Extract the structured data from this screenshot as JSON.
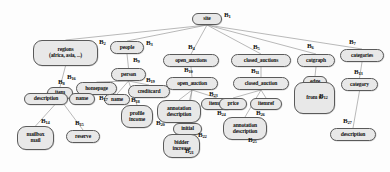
{
  "diagram": {
    "background": "#fdfdfd",
    "node_fill": "#e8e8e8",
    "node_stroke": "#5a5a5a",
    "edge_color": "#8a8a8a",
    "label_color": "#111111"
  },
  "nodes": [
    {
      "id": "site",
      "lines": [
        "site"
      ],
      "x": 192,
      "y": 13,
      "w": 30,
      "h": 12,
      "fs": 5.6
    },
    {
      "id": "regions",
      "lines": [
        "regions",
        "(africa, asia, ...)"
      ],
      "x": 33,
      "y": 40,
      "w": 65,
      "h": 26,
      "fs": 5.6
    },
    {
      "id": "people",
      "lines": [
        "people"
      ],
      "x": 110,
      "y": 41,
      "w": 34,
      "h": 13,
      "fs": 5.6
    },
    {
      "id": "open_auctions",
      "lines": [
        "open_auctions"
      ],
      "x": 163,
      "y": 54,
      "w": 56,
      "h": 13,
      "fs": 5.6
    },
    {
      "id": "closed_auctions",
      "lines": [
        "closed_auctions"
      ],
      "x": 231,
      "y": 54,
      "w": 60,
      "h": 13,
      "fs": 5.6
    },
    {
      "id": "catgraph",
      "lines": [
        "catgraph"
      ],
      "x": 297,
      "y": 54,
      "w": 38,
      "h": 13,
      "fs": 5.6
    },
    {
      "id": "categories",
      "lines": [
        "categories"
      ],
      "x": 340,
      "y": 49,
      "w": 44,
      "h": 13,
      "fs": 5.6
    },
    {
      "id": "person",
      "lines": [
        "person"
      ],
      "x": 111,
      "y": 68,
      "w": 35,
      "h": 13,
      "fs": 5.6
    },
    {
      "id": "open_auction",
      "lines": [
        "open_auction"
      ],
      "x": 166,
      "y": 77,
      "w": 52,
      "h": 13,
      "fs": 5.6
    },
    {
      "id": "closed_auction",
      "lines": [
        "closed_auction"
      ],
      "x": 233,
      "y": 77,
      "w": 56,
      "h": 13,
      "fs": 5.6
    },
    {
      "id": "edge",
      "lines": [
        "edge"
      ],
      "x": 303,
      "y": 76,
      "w": 24,
      "h": 12,
      "fs": 5.6
    },
    {
      "id": "category",
      "lines": [
        "category"
      ],
      "x": 341,
      "y": 78,
      "w": 37,
      "h": 13,
      "fs": 5.6
    },
    {
      "id": "item",
      "lines": [
        "item"
      ],
      "x": 47,
      "y": 87,
      "w": 26,
      "h": 12,
      "fs": 5.6
    },
    {
      "id": "homepage",
      "lines": [
        "homepage"
      ],
      "x": 76,
      "y": 82,
      "w": 41,
      "h": 13,
      "fs": 5.6
    },
    {
      "id": "creditcard",
      "lines": [
        "creditcard"
      ],
      "x": 128,
      "y": 85,
      "w": 42,
      "h": 13,
      "fs": 5.6
    },
    {
      "id": "name_person",
      "lines": [
        "name"
      ],
      "x": 104,
      "y": 94,
      "w": 26,
      "h": 11,
      "fs": 5.4
    },
    {
      "id": "description_item",
      "lines": [
        "description"
      ],
      "x": 24,
      "y": 93,
      "w": 44,
      "h": 12,
      "fs": 5.6
    },
    {
      "id": "name_item",
      "lines": [
        "name"
      ],
      "x": 69,
      "y": 93,
      "w": 26,
      "h": 12,
      "fs": 5.6
    },
    {
      "id": "profile_income",
      "lines": [
        "profile",
        "income"
      ],
      "x": 121,
      "y": 105,
      "w": 32,
      "h": 23,
      "fs": 5.6
    },
    {
      "id": "annotation_open",
      "lines": [
        "annotation",
        "description"
      ],
      "x": 157,
      "y": 100,
      "w": 44,
      "h": 23,
      "fs": 5.6
    },
    {
      "id": "itemref_open",
      "lines": [
        "itemref"
      ],
      "x": 201,
      "y": 98,
      "w": 32,
      "h": 12,
      "fs": 5.6
    },
    {
      "id": "initial",
      "lines": [
        "initial"
      ],
      "x": 173,
      "y": 123,
      "w": 29,
      "h": 12,
      "fs": 5.6
    },
    {
      "id": "bidder_increase",
      "lines": [
        "bidder",
        "increase"
      ],
      "x": 163,
      "y": 134,
      "w": 37,
      "h": 24,
      "fs": 5.6
    },
    {
      "id": "price",
      "lines": [
        "price"
      ],
      "x": 219,
      "y": 98,
      "w": 28,
      "h": 12,
      "fs": 5.6
    },
    {
      "id": "itemref_closed",
      "lines": [
        "itemref"
      ],
      "x": 250,
      "y": 98,
      "w": 32,
      "h": 12,
      "fs": 5.6
    },
    {
      "id": "annotation_cl",
      "lines": [
        "annotation",
        "description"
      ],
      "x": 223,
      "y": 117,
      "w": 44,
      "h": 23,
      "fs": 5.6
    },
    {
      "id": "from_to",
      "lines": [
        "from  to"
      ],
      "x": 294,
      "y": 82,
      "w": 41,
      "h": 32,
      "fs": 5.6
    },
    {
      "id": "mailbox_mail",
      "lines": [
        "mailbox",
        "mail"
      ],
      "x": 17,
      "y": 126,
      "w": 37,
      "h": 24,
      "fs": 5.6
    },
    {
      "id": "reserve",
      "lines": [
        "reserve"
      ],
      "x": 66,
      "y": 130,
      "w": 34,
      "h": 13,
      "fs": 5.6
    },
    {
      "id": "description_cat",
      "lines": [
        "description"
      ],
      "x": 330,
      "y": 128,
      "w": 46,
      "h": 13,
      "fs": 5.6
    }
  ],
  "block_labels": [
    {
      "id": "B1",
      "text": "B",
      "sub": "1",
      "x": 224,
      "y": 11
    },
    {
      "id": "B2",
      "text": "B",
      "sub": "2",
      "x": 99,
      "y": 38
    },
    {
      "id": "B3",
      "text": "B",
      "sub": "3",
      "x": 146,
      "y": 39
    },
    {
      "id": "B4",
      "text": "B",
      "sub": "4",
      "x": 188,
      "y": 43
    },
    {
      "id": "B5",
      "text": "B",
      "sub": "5",
      "x": 253,
      "y": 43
    },
    {
      "id": "B6",
      "text": "B",
      "sub": "6",
      "x": 307,
      "y": 42
    },
    {
      "id": "B7",
      "text": "B",
      "sub": "7",
      "x": 349,
      "y": 38
    },
    {
      "id": "B8",
      "text": "B",
      "sub": "8",
      "x": 58,
      "y": 78
    },
    {
      "id": "B9",
      "text": "B",
      "sub": "9",
      "x": 133,
      "y": 56
    },
    {
      "id": "B10",
      "text": "B",
      "sub": "10",
      "x": 184,
      "y": 66
    },
    {
      "id": "B11",
      "text": "B",
      "sub": "11",
      "x": 251,
      "y": 67
    },
    {
      "id": "B12",
      "text": "B",
      "sub": "12",
      "x": 319,
      "y": 92
    },
    {
      "id": "B13",
      "text": "B",
      "sub": "13",
      "x": 354,
      "y": 68
    },
    {
      "id": "B14",
      "text": "B",
      "sub": "14",
      "x": 41,
      "y": 117
    },
    {
      "id": "B15",
      "text": "B",
      "sub": "15",
      "x": 75,
      "y": 119
    },
    {
      "id": "B16",
      "text": "B",
      "sub": "16",
      "x": 67,
      "y": 73
    },
    {
      "id": "B17",
      "text": "B",
      "sub": "17",
      "x": 99,
      "y": 94
    },
    {
      "id": "B18",
      "text": "B",
      "sub": "18",
      "x": 131,
      "y": 96
    },
    {
      "id": "B19",
      "text": "B",
      "sub": "19",
      "x": 146,
      "y": 76
    },
    {
      "id": "B20",
      "text": "B",
      "sub": "20",
      "x": 156,
      "y": 119
    },
    {
      "id": "B21",
      "text": "B",
      "sub": "21",
      "x": 185,
      "y": 147
    },
    {
      "id": "B22",
      "text": "B",
      "sub": "22",
      "x": 198,
      "y": 131
    },
    {
      "id": "B23",
      "text": "B",
      "sub": "23",
      "x": 209,
      "y": 90
    },
    {
      "id": "B24",
      "text": "B",
      "sub": "24",
      "x": 217,
      "y": 109
    },
    {
      "id": "B25",
      "text": "B",
      "sub": "25",
      "x": 248,
      "y": 136
    },
    {
      "id": "B26",
      "text": "B",
      "sub": "26",
      "x": 256,
      "y": 109
    },
    {
      "id": "B27",
      "text": "B",
      "sub": "27",
      "x": 343,
      "y": 117
    }
  ],
  "edges": [
    {
      "from": "site",
      "to": "regions"
    },
    {
      "from": "site",
      "to": "people"
    },
    {
      "from": "site",
      "to": "open_auctions"
    },
    {
      "from": "site",
      "to": "closed_auctions"
    },
    {
      "from": "site",
      "to": "catgraph"
    },
    {
      "from": "site",
      "to": "categories"
    },
    {
      "from": "regions",
      "to": "item"
    },
    {
      "from": "people",
      "to": "person"
    },
    {
      "from": "open_auctions",
      "to": "open_auction"
    },
    {
      "from": "closed_auctions",
      "to": "closed_auction"
    },
    {
      "from": "catgraph",
      "to": "edge"
    },
    {
      "from": "categories",
      "to": "category"
    },
    {
      "from": "person",
      "to": "homepage"
    },
    {
      "from": "person",
      "to": "name_person"
    },
    {
      "from": "person",
      "to": "creditcard"
    },
    {
      "from": "person",
      "to": "profile_income"
    },
    {
      "from": "item",
      "to": "description_item"
    },
    {
      "from": "item",
      "to": "name_item"
    },
    {
      "from": "item",
      "to": "mailbox_mail"
    },
    {
      "from": "item",
      "to": "reserve"
    },
    {
      "from": "open_auction",
      "to": "annotation_open"
    },
    {
      "from": "open_auction",
      "to": "itemref_open"
    },
    {
      "from": "open_auction",
      "to": "initial"
    },
    {
      "from": "open_auction",
      "to": "bidder_increase"
    },
    {
      "from": "closed_auction",
      "to": "price"
    },
    {
      "from": "closed_auction",
      "to": "itemref_closed"
    },
    {
      "from": "closed_auction",
      "to": "annotation_cl"
    },
    {
      "from": "edge",
      "to": "from_to"
    },
    {
      "from": "category",
      "to": "description_cat"
    }
  ]
}
